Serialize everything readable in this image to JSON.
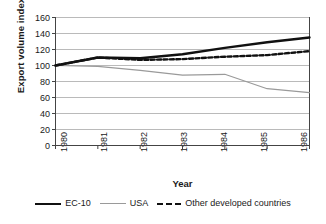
{
  "chart_data": {
    "type": "line",
    "title": "",
    "xlabel": "Year",
    "ylabel": "Export volume index",
    "x": [
      1980,
      1981,
      1982,
      1983,
      1984,
      1985,
      1986
    ],
    "xticklabels": [
      "1980",
      "1981",
      "1982",
      "1983",
      "1984",
      "1985",
      "1986"
    ],
    "xlim": [
      1980,
      1986
    ],
    "ylim": [
      0,
      160
    ],
    "yticks": [
      0,
      20,
      40,
      60,
      80,
      100,
      120,
      140,
      160
    ],
    "yticklabels": [
      "0",
      "20",
      "40",
      "60",
      "80",
      "100",
      "120",
      "140",
      "160"
    ],
    "grid": "horizontal",
    "legend_position": "bottom",
    "series": [
      {
        "name": "EC-10",
        "style": "solid-thick",
        "color": "#111111",
        "values": [
          100,
          110,
          109,
          114,
          122,
          129,
          135
        ]
      },
      {
        "name": "USA",
        "style": "solid-thin",
        "color": "#9a9a9a",
        "values": [
          100,
          99,
          94,
          88,
          89,
          71,
          66
        ]
      },
      {
        "name": "Other developed countries",
        "style": "dashed",
        "color": "#111111",
        "values": [
          100,
          110,
          107,
          108,
          111,
          113,
          118
        ]
      }
    ]
  },
  "legend": {
    "items": [
      {
        "label": "EC-10",
        "swatch": "solid-thick-black"
      },
      {
        "label": "USA",
        "swatch": "solid-thin-gray"
      },
      {
        "label": "Other developed countries",
        "swatch": "dashed-black"
      }
    ]
  },
  "axes": {
    "ylabel": "Export volume index",
    "xlabel": "Year"
  }
}
